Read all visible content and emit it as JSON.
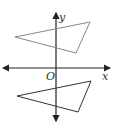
{
  "diagram": {
    "axes": {
      "x_label": "x",
      "y_label": "y",
      "origin_label": "O"
    },
    "triangles": [
      {
        "name": "upper-triangle",
        "points": "15,37 90,22 76,53",
        "color": "#888888"
      },
      {
        "name": "lower-triangle",
        "points": "17,96 91,81 78,112",
        "color": "#333333"
      }
    ]
  }
}
